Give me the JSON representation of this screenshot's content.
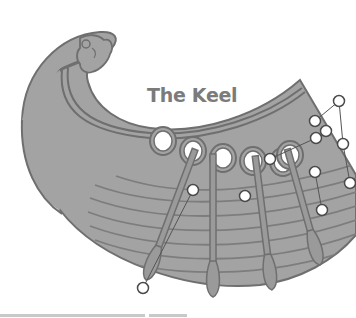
{
  "diagram": {
    "title": "The Keel",
    "colors": {
      "hull_fill": "#a3a3a3",
      "hull_stroke": "#6f6f6f",
      "plank_line": "#7d7d7d",
      "oar_fill": "#9a9a9a",
      "callout_fill": "#ffffff",
      "callout_stroke": "#4a4a4a",
      "leader_line": "#555555",
      "title_color": "#7b7b7b",
      "footer_bar": "#c9c9c9"
    },
    "oar_ports": [
      {
        "cx": 163,
        "cy": 141
      },
      {
        "cx": 193,
        "cy": 151
      },
      {
        "cx": 223,
        "cy": 158
      },
      {
        "cx": 253,
        "cy": 161
      },
      {
        "cx": 283,
        "cy": 162
      },
      {
        "cx": 290,
        "cy": 155
      }
    ],
    "oars": [
      {
        "x1": 193,
        "y1": 155,
        "x2": 146,
        "y2": 280
      },
      {
        "x1": 213,
        "y1": 160,
        "x2": 213,
        "y2": 297
      },
      {
        "x1": 256,
        "y1": 162,
        "x2": 272,
        "y2": 290
      },
      {
        "x1": 289,
        "y1": 155,
        "x2": 320,
        "y2": 265
      }
    ],
    "callouts": [
      {
        "id": "c1",
        "cx": 143,
        "cy": 288
      },
      {
        "id": "c2",
        "cx": 193,
        "cy": 190
      },
      {
        "id": "c3",
        "cx": 245,
        "cy": 196
      },
      {
        "id": "c4",
        "cx": 270,
        "cy": 159
      },
      {
        "id": "c5",
        "cx": 315,
        "cy": 172
      },
      {
        "id": "c6",
        "cx": 322,
        "cy": 210
      },
      {
        "id": "c7",
        "cx": 339,
        "cy": 101
      },
      {
        "id": "c8",
        "cx": 315,
        "cy": 121
      },
      {
        "id": "c9",
        "cx": 326,
        "cy": 131
      },
      {
        "id": "c10",
        "cx": 316,
        "cy": 138
      },
      {
        "id": "c11",
        "cx": 343,
        "cy": 144
      },
      {
        "id": "c12",
        "cx": 350,
        "cy": 183
      }
    ],
    "leaders": [
      {
        "x1": 143,
        "y1": 288,
        "x2": 193,
        "y2": 190
      },
      {
        "x1": 270,
        "y1": 159,
        "x2": 316,
        "y2": 138
      },
      {
        "x1": 315,
        "y1": 172,
        "x2": 322,
        "y2": 210
      },
      {
        "x1": 315,
        "y1": 121,
        "x2": 339,
        "y2": 101
      },
      {
        "x1": 339,
        "y1": 101,
        "x2": 343,
        "y2": 144
      },
      {
        "x1": 343,
        "y1": 144,
        "x2": 350,
        "y2": 183
      }
    ],
    "footer_bars": [
      {
        "left": 0,
        "width": 145
      },
      {
        "left": 149,
        "width": 38
      }
    ]
  }
}
